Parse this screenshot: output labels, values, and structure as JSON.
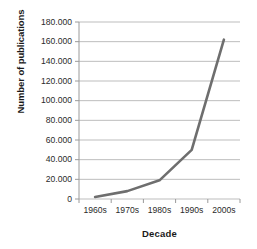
{
  "chart_data": {
    "type": "line",
    "title": "",
    "xlabel": "Decade",
    "ylabel": "Number of publications",
    "categories": [
      "1960s",
      "1970s",
      "1980s",
      "1990s",
      "2000s"
    ],
    "values": [
      2000,
      8000,
      19000,
      50000,
      162000
    ],
    "ytick_labels": [
      "0",
      "20.000",
      "40.000",
      "60.000",
      "80.000",
      "100.000",
      "120.000",
      "140.000",
      "160.000",
      "180.000"
    ],
    "ytick_values": [
      0,
      20000,
      40000,
      60000,
      80000,
      100000,
      120000,
      140000,
      160000,
      180000
    ],
    "ylim": [
      0,
      180000
    ],
    "grid": "horizontal",
    "legend": "none",
    "series": [
      {
        "name": "Number of publications",
        "values": [
          2000,
          8000,
          19000,
          50000,
          162000
        ],
        "color": "#6e6e6e"
      }
    ],
    "colors": {
      "line": "#6e6e6e",
      "grid": "#b5b5b5",
      "axis": "#9a9a9a",
      "text": "#1a1a1a",
      "background": "#ffffff"
    }
  }
}
